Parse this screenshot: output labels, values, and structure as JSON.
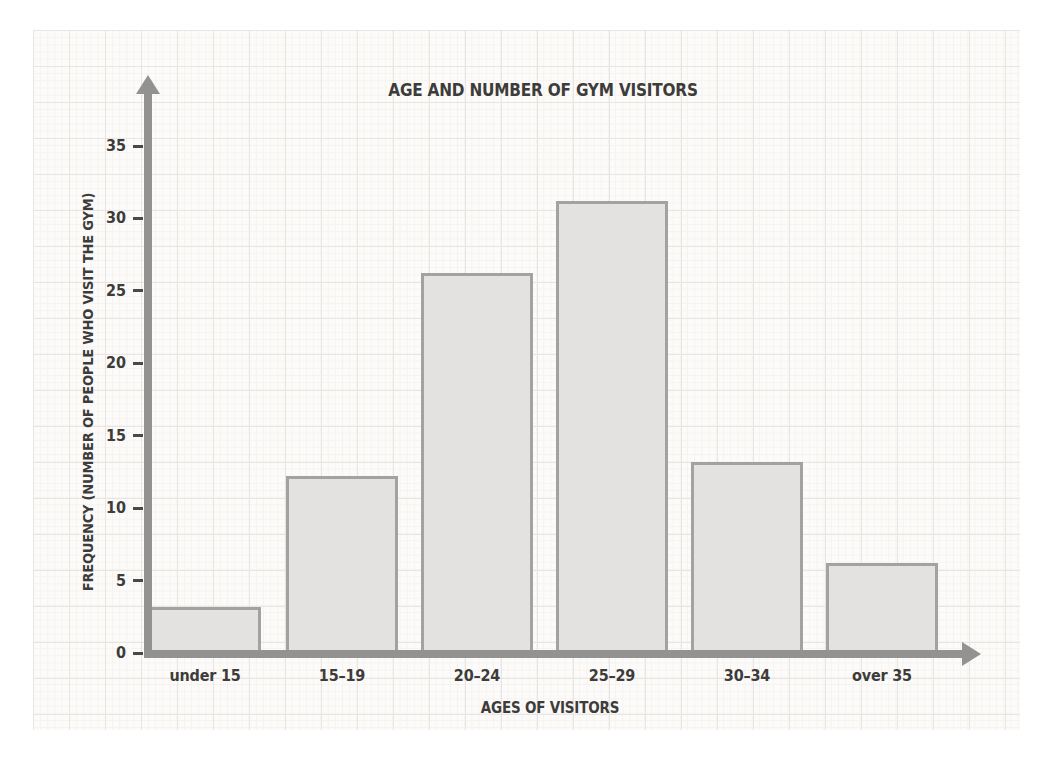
{
  "chart_data": {
    "type": "bar",
    "title": "AGE AND NUMBER OF GYM VISITORS",
    "xlabel": "AGES OF VISITORS",
    "ylabel": "FREQUENCY (NUMBER OF PEOPLE WHO VISIT THE GYM)",
    "categories": [
      "under 15",
      "15–19",
      "20–24",
      "25–29",
      "30–34",
      "over 35"
    ],
    "values": [
      3,
      12,
      26,
      31,
      13,
      6
    ],
    "yticks": [
      0,
      5,
      10,
      15,
      20,
      25,
      30,
      35
    ],
    "ylim": [
      0,
      38
    ],
    "grid": "graph-paper background (faint minor and major gridlines), no plot gridlines",
    "legend": "none",
    "colors": {
      "bar_fill": "#e3e2e0",
      "bar_border": "#a2a2a0",
      "axis": "#929290",
      "text": "#3d3c3a",
      "paper": "#fcfbf9",
      "grid_major": "#e7e6e2",
      "grid_minor": "#f4f3f0",
      "page_margin": "#ffffff"
    }
  }
}
